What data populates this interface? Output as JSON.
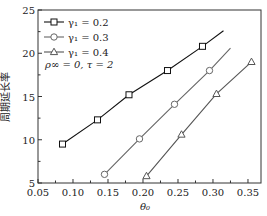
{
  "chart_data": {
    "type": "line",
    "title": "",
    "xlabel": "θ0",
    "ylabel": "周期延长率",
    "xlim": [
      0.05,
      0.37
    ],
    "ylim": [
      5,
      25
    ],
    "xticks": [
      "0.05",
      "0.10",
      "0.15",
      "0.20",
      "0.25",
      "0.30",
      "0.35"
    ],
    "yticks": [
      "5",
      "10",
      "15",
      "20",
      "25"
    ],
    "grid": false,
    "legend_position": "upper left",
    "annotation": "ρ∞ = 0, τ = 2",
    "series": [
      {
        "name": "γ1 = 0.2",
        "marker": "square",
        "color": "#111111",
        "x": [
          0.085,
          0.135,
          0.18,
          0.235,
          0.285
        ],
        "y": [
          9.5,
          12.3,
          15.2,
          18.0,
          20.8
        ],
        "line_end": [
          0.315,
          22.6
        ]
      },
      {
        "name": "γ1 = 0.3",
        "marker": "circle",
        "color": "#666666",
        "x": [
          0.145,
          0.195,
          0.245,
          0.295
        ],
        "y": [
          6.0,
          10.1,
          14.1,
          18.0
        ],
        "line_end": [
          0.325,
          20.6
        ]
      },
      {
        "name": "γ1 = 0.4",
        "marker": "triangle",
        "color": "#555555",
        "x": [
          0.205,
          0.255,
          0.305,
          0.355
        ],
        "y": [
          5.8,
          10.6,
          15.3,
          19.0
        ],
        "line_end": null
      }
    ]
  },
  "legend": {
    "items": [
      "γ₁ = 0.2",
      "γ₁ = 0.3",
      "γ₁ = 0.4"
    ],
    "annotation": "ρ∞ = 0, τ = 2"
  },
  "axes": {
    "xlabel": "θ₀",
    "ylabel": "周期延长率"
  }
}
